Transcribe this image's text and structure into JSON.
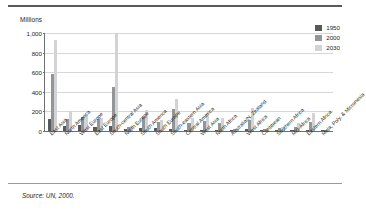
{
  "figure": {
    "axis_title": "Millions",
    "source_note": "Source: UN, 2000."
  },
  "legend": {
    "position": "top-right",
    "entries": [
      {
        "label": "1950",
        "color": "#58595b"
      },
      {
        "label": "2000",
        "color": "#939598"
      },
      {
        "label": "2030",
        "color": "#d1d3d4"
      }
    ]
  },
  "chart_data": {
    "type": "bar",
    "title": "",
    "subtitle": "",
    "xlabel": "",
    "ylabel": "Millions",
    "ylim": [
      0,
      1000
    ],
    "yticks": [
      "0",
      "200",
      "400",
      "600",
      "800",
      "1,000"
    ],
    "grid": true,
    "legend_position": "top-right",
    "categories": [
      "East Asia",
      "North America",
      "West Europe",
      "East Europe",
      "South-central Asia",
      "North Europe",
      "South America",
      "South Europe",
      "South-eastern Asia",
      "Central America",
      "West Asia",
      "North Africa",
      "Australia/N. Zealand",
      "West Africa",
      "Caribbean",
      "Southern Africa",
      "Mid-Africa",
      "Eastern Africa",
      "Mela, Poly, & Micronesia"
    ],
    "series": [
      {
        "name": "1950",
        "color": "#58595b",
        "values": [
          120,
          50,
          60,
          45,
          55,
          20,
          28,
          30,
          25,
          12,
          14,
          10,
          4,
          18,
          6,
          5,
          7,
          15,
          2
        ]
      },
      {
        "name": "2000",
        "color": "#939598",
        "values": [
          580,
          125,
          140,
          120,
          450,
          45,
          145,
          95,
          220,
          80,
          100,
          80,
          17,
          115,
          22,
          30,
          45,
          95,
          8
        ]
      },
      {
        "name": "2030",
        "color": "#d1d3d4",
        "values": [
          930,
          200,
          165,
          130,
          1000,
          55,
          210,
          110,
          330,
          130,
          185,
          130,
          22,
          230,
          30,
          40,
          80,
          185,
          12
        ]
      }
    ],
    "annotations": [
      "Source: UN, 2000."
    ]
  }
}
